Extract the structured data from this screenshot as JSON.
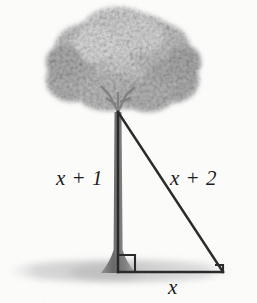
{
  "figure": {
    "kind": "geometry-diagram",
    "background_color": "#fdfdfc"
  },
  "labels": {
    "vertical_leg": "x + 1",
    "hypotenuse": "x + 2",
    "horizontal_leg": "x"
  },
  "colors": {
    "line": "#262626",
    "canopy_light": "#d7d7d7",
    "canopy_mid": "#bdbdbd",
    "canopy_dark": "#a3a3a3",
    "trunk": "#6e6e6e",
    "ground_shadow": "#cfcfcf",
    "text": "#1c1c1c"
  },
  "geometry": {
    "apex": {
      "x": 118,
      "y": 112
    },
    "right_angle_vertex": {
      "x": 118,
      "y": 272
    },
    "far_vertex": {
      "x": 223,
      "y": 272
    },
    "right_angle_marker_size": 17
  },
  "markers": {
    "right_angle": "right-angle-square",
    "far_vertex_tick": "corner-tick"
  }
}
